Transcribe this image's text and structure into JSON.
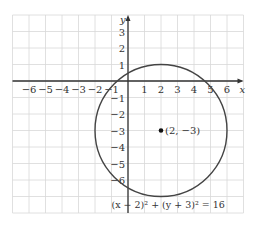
{
  "figure": {
    "type": "coordinate-plane",
    "axes": {
      "x_label": "x",
      "y_label": "y"
    },
    "x_ticks": [
      "-6",
      "-5",
      "-4",
      "-3",
      "-2",
      "-1",
      "1",
      "2",
      "3",
      "4",
      "5",
      "6"
    ],
    "y_ticks": [
      "3",
      "2",
      "1",
      "-1",
      "-2",
      "-3",
      "-4",
      "-5",
      "-6"
    ],
    "circle": {
      "center": [
        2,
        -3
      ],
      "radius": 4
    },
    "center_label": "(2, −3)",
    "equation": "(x − 2)² + (y + 3)² = 16",
    "colors": {
      "grid": "#d8d8d8",
      "axis": "#333333",
      "circle": "#444444"
    }
  }
}
